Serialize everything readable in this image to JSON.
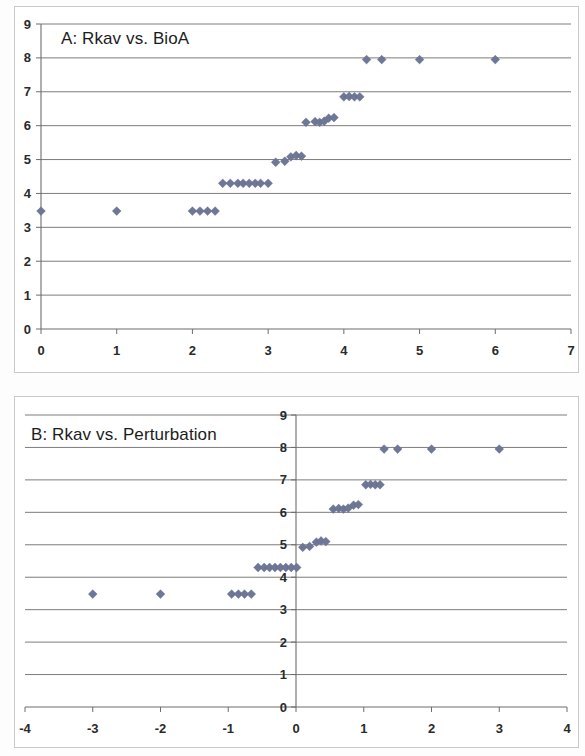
{
  "document": {
    "kind": "scatter-plot-figure",
    "panel_count": 2
  },
  "colors": {
    "marker": "#6e7796",
    "gridline": "#6d6d6d",
    "axis": "#6d6d6d",
    "panel_border": "#c9c9c9",
    "background": "#ffffff",
    "text": "#1c1c1c"
  },
  "panels": [
    {
      "id": "panel-a",
      "title": "A: Rkav vs. BioA",
      "x_ticks": [
        "0",
        "1",
        "2",
        "3",
        "4",
        "5",
        "6",
        "7"
      ],
      "y_ticks": [
        "0",
        "1",
        "2",
        "3",
        "4",
        "5",
        "6",
        "7",
        "8",
        "9"
      ]
    },
    {
      "id": "panel-b",
      "title": "B: Rkav vs. Perturbation",
      "x_ticks": [
        "-4",
        "-3",
        "-2",
        "-1",
        "0",
        "1",
        "2",
        "3",
        "4"
      ],
      "y_ticks": [
        "0",
        "1",
        "2",
        "3",
        "4",
        "5",
        "6",
        "7",
        "8",
        "9"
      ]
    }
  ],
  "chart_data": [
    {
      "type": "scatter",
      "title": "A: Rkav vs. BioA",
      "xlabel": "",
      "ylabel": "",
      "xlim": [
        0,
        7
      ],
      "ylim": [
        0,
        9
      ],
      "xticks": [
        0,
        1,
        2,
        3,
        4,
        5,
        6,
        7
      ],
      "yticks": [
        0,
        1,
        2,
        3,
        4,
        5,
        6,
        7,
        8,
        9
      ],
      "grid": "horizontal",
      "legend": "none",
      "marker": "diamond",
      "marker_color": "#6e7796",
      "points": [
        {
          "x": 0.0,
          "y": 3.48
        },
        {
          "x": 1.0,
          "y": 3.48
        },
        {
          "x": 2.0,
          "y": 3.48
        },
        {
          "x": 2.1,
          "y": 3.48
        },
        {
          "x": 2.2,
          "y": 3.48
        },
        {
          "x": 2.3,
          "y": 3.48
        },
        {
          "x": 2.4,
          "y": 4.3
        },
        {
          "x": 2.5,
          "y": 4.3
        },
        {
          "x": 2.6,
          "y": 4.3
        },
        {
          "x": 2.67,
          "y": 4.3
        },
        {
          "x": 2.75,
          "y": 4.3
        },
        {
          "x": 2.83,
          "y": 4.3
        },
        {
          "x": 2.9,
          "y": 4.3
        },
        {
          "x": 3.0,
          "y": 4.3
        },
        {
          "x": 3.1,
          "y": 4.92
        },
        {
          "x": 3.22,
          "y": 4.95
        },
        {
          "x": 3.3,
          "y": 5.08
        },
        {
          "x": 3.37,
          "y": 5.12
        },
        {
          "x": 3.44,
          "y": 5.1
        },
        {
          "x": 3.5,
          "y": 6.1
        },
        {
          "x": 3.62,
          "y": 6.12
        },
        {
          "x": 3.68,
          "y": 6.1
        },
        {
          "x": 3.74,
          "y": 6.13
        },
        {
          "x": 3.8,
          "y": 6.22
        },
        {
          "x": 3.87,
          "y": 6.24
        },
        {
          "x": 4.0,
          "y": 6.85
        },
        {
          "x": 4.07,
          "y": 6.86
        },
        {
          "x": 4.14,
          "y": 6.85
        },
        {
          "x": 4.21,
          "y": 6.85
        },
        {
          "x": 4.3,
          "y": 7.95
        },
        {
          "x": 4.5,
          "y": 7.95
        },
        {
          "x": 5.0,
          "y": 7.95
        },
        {
          "x": 6.0,
          "y": 7.95
        }
      ]
    },
    {
      "type": "scatter",
      "title": "B: Rkav vs. Perturbation",
      "xlabel": "",
      "ylabel": "",
      "xlim": [
        -4,
        4
      ],
      "ylim": [
        0,
        9
      ],
      "xticks": [
        -4,
        -3,
        -2,
        -1,
        0,
        1,
        2,
        3,
        4
      ],
      "yticks": [
        0,
        1,
        2,
        3,
        4,
        5,
        6,
        7,
        8,
        9
      ],
      "grid": "horizontal",
      "legend": "none",
      "marker": "diamond",
      "marker_color": "#6e7796",
      "points": [
        {
          "x": -3.0,
          "y": 3.48
        },
        {
          "x": -2.0,
          "y": 3.48
        },
        {
          "x": -0.95,
          "y": 3.48
        },
        {
          "x": -0.85,
          "y": 3.48
        },
        {
          "x": -0.76,
          "y": 3.48
        },
        {
          "x": -0.66,
          "y": 3.48
        },
        {
          "x": -0.56,
          "y": 4.3
        },
        {
          "x": -0.47,
          "y": 4.3
        },
        {
          "x": -0.39,
          "y": 4.3
        },
        {
          "x": -0.31,
          "y": 4.3
        },
        {
          "x": -0.23,
          "y": 4.3
        },
        {
          "x": -0.15,
          "y": 4.3
        },
        {
          "x": -0.07,
          "y": 4.3
        },
        {
          "x": 0.01,
          "y": 4.3
        },
        {
          "x": 0.1,
          "y": 4.92
        },
        {
          "x": 0.2,
          "y": 4.95
        },
        {
          "x": 0.3,
          "y": 5.08
        },
        {
          "x": 0.37,
          "y": 5.12
        },
        {
          "x": 0.44,
          "y": 5.1
        },
        {
          "x": 0.55,
          "y": 6.1
        },
        {
          "x": 0.63,
          "y": 6.12
        },
        {
          "x": 0.7,
          "y": 6.1
        },
        {
          "x": 0.77,
          "y": 6.13
        },
        {
          "x": 0.85,
          "y": 6.22
        },
        {
          "x": 0.92,
          "y": 6.24
        },
        {
          "x": 1.03,
          "y": 6.85
        },
        {
          "x": 1.1,
          "y": 6.86
        },
        {
          "x": 1.17,
          "y": 6.85
        },
        {
          "x": 1.24,
          "y": 6.85
        },
        {
          "x": 1.3,
          "y": 7.95
        },
        {
          "x": 1.5,
          "y": 7.95
        },
        {
          "x": 2.0,
          "y": 7.95
        },
        {
          "x": 3.0,
          "y": 7.95
        }
      ]
    }
  ]
}
